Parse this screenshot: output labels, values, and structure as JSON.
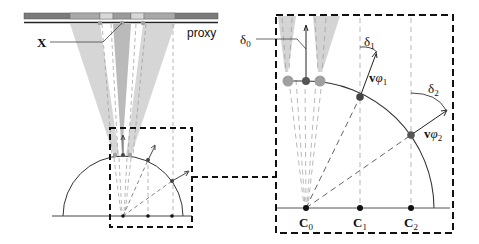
{
  "diagram": {
    "left_panel": {
      "proxy_label": "proxy",
      "x_label": "X"
    },
    "right_panel": {
      "delta_labels": [
        {
          "symbol": "δ",
          "sub": "0"
        },
        {
          "symbol": "δ",
          "sub": "1"
        },
        {
          "symbol": "δ",
          "sub": "2"
        }
      ],
      "velocity_labels": [
        {
          "symbol": "v",
          "greek": "φ",
          "sub": "1"
        },
        {
          "symbol": "v",
          "greek": "φ",
          "sub": "2"
        }
      ],
      "center_labels": [
        {
          "symbol": "C",
          "sub": "0"
        },
        {
          "symbol": "C",
          "sub": "1"
        },
        {
          "symbol": "C",
          "sub": "2"
        }
      ]
    },
    "colors": {
      "bar_dark": "#7a7a7a",
      "bar_mid": "#a6a6a6",
      "bar_light": "#d6d6d6",
      "cone_fill": "#c8c8c8",
      "cone_overlap": "#a8a8a8",
      "dot_dark": "#444444",
      "dot_light": "#a0a0a0",
      "line": "#333333",
      "dash": "#888888"
    }
  }
}
